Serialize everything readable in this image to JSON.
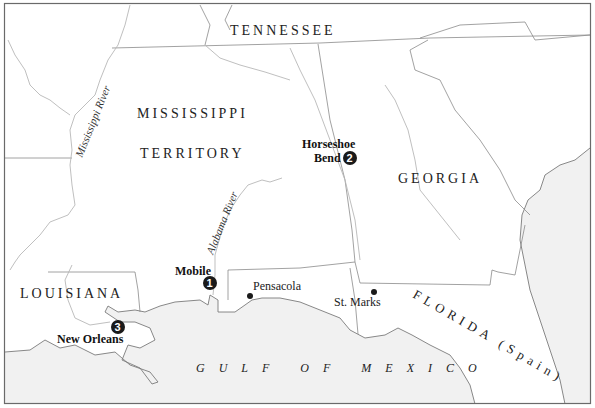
{
  "map": {
    "regions": [
      {
        "id": "tennessee",
        "label": "TENNESSEE"
      },
      {
        "id": "mississippi-territory-1",
        "label": "MISSISSIPPI"
      },
      {
        "id": "mississippi-territory-2",
        "label": "TERRITORY"
      },
      {
        "id": "georgia",
        "label": "GEORGIA"
      },
      {
        "id": "louisiana",
        "label": "LOUISIANA"
      },
      {
        "id": "florida",
        "label": "FLORIDA (Spain)"
      }
    ],
    "water": {
      "gulf": "GULF OF MEXICO"
    },
    "rivers": [
      {
        "id": "mississippi-river",
        "label": "Mississippi River"
      },
      {
        "id": "alabama-river",
        "label": "Alabama River"
      }
    ],
    "cities": [
      {
        "id": "pensacola",
        "label": "Pensacola"
      },
      {
        "id": "st-marks",
        "label": "St. Marks"
      }
    ],
    "battles": [
      {
        "id": "mobile",
        "label": "Mobile",
        "number": "1"
      },
      {
        "id": "horseshoe-bend",
        "label_line1": "Horseshoe",
        "label_line2": "Bend",
        "number": "2"
      },
      {
        "id": "new-orleans",
        "label": "New Orleans",
        "number": "3"
      }
    ],
    "colors": {
      "water": "#f1f1f1",
      "land": "#ffffff",
      "marker": "#1a1a1a"
    }
  }
}
